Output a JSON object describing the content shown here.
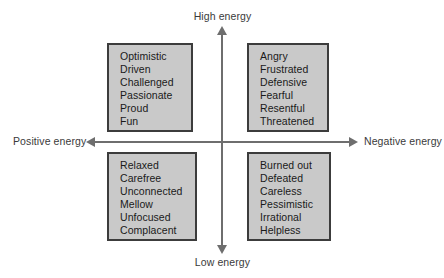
{
  "diagram": {
    "background_color": "#ffffff",
    "axis_color": "#6e6e6e",
    "box_fill_color": "#c9c9c9",
    "box_border_color": "#3c3c3c",
    "text_color": "#1a1a1a",
    "axes": {
      "top_label": "High energy",
      "bottom_label": "Low energy",
      "left_label": "Positive energy",
      "right_label": "Negative energy"
    },
    "quadrants": [
      {
        "id": "top-left",
        "position": "high-energy-positive-energy",
        "items": [
          "Optimistic",
          "Driven",
          "Challenged",
          "Passionate",
          "Proud",
          "Fun"
        ]
      },
      {
        "id": "top-right",
        "position": "high-energy-negative-energy",
        "items": [
          "Angry",
          "Frustrated",
          "Defensive",
          "Fearful",
          "Resentful",
          "Threatened"
        ]
      },
      {
        "id": "bottom-left",
        "position": "low-energy-positive-energy",
        "items": [
          "Relaxed",
          "Carefree",
          "Unconnected",
          "Mellow",
          "Unfocused",
          "Complacent"
        ]
      },
      {
        "id": "bottom-right",
        "position": "low-energy-negative-energy",
        "items": [
          "Burned out",
          "Defeated",
          "Careless",
          "Pessimistic",
          "Irrational",
          "Helpless"
        ]
      }
    ]
  }
}
